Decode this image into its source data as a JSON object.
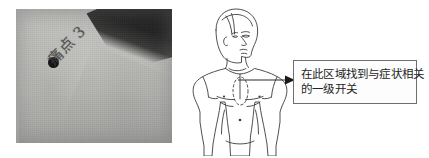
{
  "figure": {
    "name": "chest-reflex-zone-figure",
    "panels": [
      "photograph",
      "anatomy-diagram",
      "callout"
    ]
  },
  "photo": {
    "name": "chest-photograph",
    "marker_label": "ink-dot-marker",
    "handwriting": "痛点 3",
    "background_color": "#bcbcb9",
    "marker_color": "#151515",
    "shadow_color": "#1c1c1c"
  },
  "diagram": {
    "name": "male-torso-anatomy-diagram",
    "view": "upper body, three-quarter head turned right",
    "line_color": "#3c3c3c",
    "fill_color": "#ffffff",
    "markers": [
      {
        "name": "dashed-zone-sternum",
        "shape": "dashed-ellipse"
      },
      {
        "name": "point-left-chest",
        "shape": "dot"
      },
      {
        "name": "point-right-chest",
        "shape": "dot"
      },
      {
        "name": "point-navel",
        "shape": "dot"
      }
    ]
  },
  "callout": {
    "name": "instruction-callout",
    "arrow_direction": "right",
    "border_color": "#6e6e6e",
    "background_color": "#fdfdfd",
    "text_color": "#232323",
    "line1": "在此区域找到与症状相关",
    "line2": "的一级开关",
    "full_text": "在此区域找到与症状相关的一级开关"
  }
}
